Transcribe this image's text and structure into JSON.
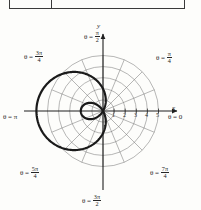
{
  "figure": {
    "kind": "polar-plot",
    "axis_labels": {
      "x": "x",
      "y": "y"
    },
    "tick_numbers": [
      "1",
      "2",
      "3",
      "4",
      "5"
    ],
    "angle_labels": [
      {
        "id": "theta-0",
        "prefix": "θ =",
        "whole": "0",
        "num": "",
        "den": ""
      },
      {
        "id": "theta-pi-4",
        "prefix": "θ =",
        "whole": "",
        "num": "π",
        "den": "4"
      },
      {
        "id": "theta-pi-2",
        "prefix": "θ =",
        "whole": "",
        "num": "π",
        "den": "2"
      },
      {
        "id": "theta-3pi-4",
        "prefix": "θ =",
        "whole": "",
        "num": "3π",
        "den": "4"
      },
      {
        "id": "theta-pi",
        "prefix": "θ =",
        "whole": "π",
        "num": "",
        "den": ""
      },
      {
        "id": "theta-5pi-4",
        "prefix": "θ =",
        "whole": "",
        "num": "5π",
        "den": "4"
      },
      {
        "id": "theta-3pi-2",
        "prefix": "θ =",
        "whole": "",
        "num": "3π",
        "den": "2"
      },
      {
        "id": "theta-7pi-4",
        "prefix": "θ =",
        "whole": "",
        "num": "7π",
        "den": "4"
      }
    ],
    "colors": {
      "curve": "#1a1a1a",
      "grid": "#6f6f6f",
      "axis": "#1f1f1f",
      "background": "#fdfdfb",
      "rule": "#3a3a3a"
    }
  },
  "chart_data": {
    "type": "line",
    "coordinate_system": "polar",
    "title": "",
    "xlabel": "x",
    "ylabel": "y",
    "r_ticks": [
      1,
      2,
      3,
      4,
      5
    ],
    "r_max": 5,
    "grid": true,
    "grid_circles": 5,
    "radial_spokes_deg": [
      0,
      22.5,
      45,
      67.5,
      90,
      112.5,
      135,
      157.5,
      180,
      202.5,
      225,
      247.5,
      270,
      292.5,
      315,
      337.5
    ],
    "angle_tick_labels": [
      {
        "deg": 0,
        "text": "θ = 0"
      },
      {
        "deg": 45,
        "text": "θ = π/4"
      },
      {
        "deg": 90,
        "text": "θ = π/2"
      },
      {
        "deg": 135,
        "text": "θ = 3π/4"
      },
      {
        "deg": 180,
        "text": "θ = π"
      },
      {
        "deg": 225,
        "text": "θ = 5π/4"
      },
      {
        "deg": 270,
        "text": "θ = 3π/2"
      },
      {
        "deg": 315,
        "text": "θ = 7π/4"
      }
    ],
    "series": [
      {
        "name": "limacon-with-inner-loop",
        "equation": "r = 2 - 4 cos θ",
        "r_at_theta_0": -2,
        "r_at_theta_pi": 6,
        "theta_deg": [
          0,
          10,
          20,
          30,
          40,
          50,
          60,
          70,
          80,
          90,
          100,
          110,
          120,
          130,
          140,
          150,
          160,
          170,
          180,
          190,
          200,
          210,
          220,
          230,
          240,
          250,
          260,
          270,
          280,
          290,
          300,
          310,
          320,
          330,
          340,
          350,
          360
        ],
        "r": [
          -2.0,
          -1.94,
          -1.76,
          -1.46,
          -1.06,
          -0.57,
          0.0,
          0.63,
          1.31,
          2.0,
          2.69,
          3.37,
          4.0,
          4.57,
          5.06,
          5.46,
          5.76,
          5.94,
          6.0,
          5.94,
          5.76,
          5.46,
          5.06,
          4.57,
          4.0,
          3.37,
          2.69,
          2.0,
          1.31,
          0.63,
          0.0,
          -0.57,
          -1.06,
          -1.46,
          -1.76,
          -1.94,
          -2.0
        ]
      }
    ]
  }
}
